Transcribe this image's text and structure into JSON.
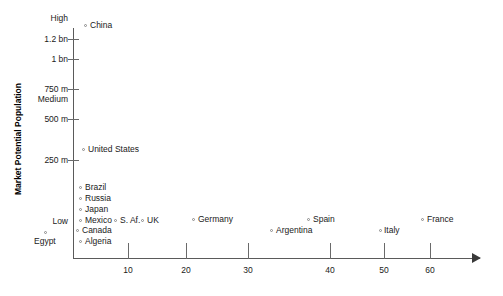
{
  "chart_data": {
    "type": "scatter",
    "title": "",
    "xlabel": "",
    "ylabel": "Market Potential Population",
    "xlim": [
      0,
      67
    ],
    "ylim": [
      0,
      1350
    ],
    "grid": false,
    "legend": null,
    "x_ticks": [
      {
        "label": "10",
        "value": 10,
        "px": 128
      },
      {
        "label": "20",
        "value": 20,
        "px": 186
      },
      {
        "label": "30",
        "value": 30,
        "px": 248
      },
      {
        "label": "40",
        "value": 40,
        "px": 330
      },
      {
        "label": "50",
        "value": 50,
        "px": 384
      },
      {
        "label": "60",
        "value": 60,
        "px": 430
      }
    ],
    "y_ticks": [
      {
        "label": "1.2 bn",
        "value": 1200,
        "px": 34,
        "tick": true
      },
      {
        "label": "1 bn",
        "value": 1000,
        "px": 54,
        "tick": true
      },
      {
        "label": "750 m",
        "value": 750,
        "px": 84,
        "tick": true
      },
      {
        "label": "500 m",
        "value": 500,
        "px": 114,
        "tick": true
      },
      {
        "label": "250 m",
        "value": 250,
        "px": 155,
        "tick": true
      }
    ],
    "y_band_labels": [
      {
        "label": "High",
        "px": 13
      },
      {
        "label": "Medium",
        "px": 94
      },
      {
        "label": "Low",
        "px": 216
      }
    ],
    "points": [
      {
        "name": "China",
        "x": 1.5,
        "y": 1300,
        "mx": 84,
        "my": 24,
        "lx": 90,
        "ly": 20
      },
      {
        "name": "United States",
        "x": 1.0,
        "y": 290,
        "mx": 82,
        "my": 148,
        "lx": 88,
        "ly": 144
      },
      {
        "name": "Brazil",
        "x": 0.5,
        "y": 175,
        "mx": 79,
        "my": 186,
        "lx": 85,
        "ly": 182
      },
      {
        "name": "Russia",
        "x": 0.5,
        "y": 145,
        "mx": 79,
        "my": 197,
        "lx": 85,
        "ly": 193
      },
      {
        "name": "Japan",
        "x": 0.5,
        "y": 125,
        "mx": 79,
        "my": 208,
        "lx": 85,
        "ly": 204
      },
      {
        "name": "Mexico",
        "x": 0.5,
        "y": 100,
        "mx": 79,
        "my": 219,
        "lx": 85,
        "ly": 215
      },
      {
        "name": "S. Af.",
        "x": 6.5,
        "y": 100,
        "mx": 114,
        "my": 219,
        "lx": 120,
        "ly": 215
      },
      {
        "name": "UK",
        "x": 11.0,
        "y": 100,
        "mx": 141,
        "my": 219,
        "lx": 147,
        "ly": 215
      },
      {
        "name": "Canada",
        "x": 0.2,
        "y": 75,
        "mx": 76,
        "my": 229,
        "lx": 82,
        "ly": 225
      },
      {
        "name": "Algeria",
        "x": 0.5,
        "y": 55,
        "mx": 79,
        "my": 240,
        "lx": 85,
        "ly": 236
      },
      {
        "name": "Egypt",
        "x": 0,
        "y": 70,
        "mx": 44,
        "my": 231,
        "lx": 34,
        "ly": 236
      },
      {
        "name": "Germany",
        "x": 20.5,
        "y": 105,
        "mx": 192,
        "my": 218,
        "lx": 198,
        "ly": 214
      },
      {
        "name": "Argentina",
        "x": 32.5,
        "y": 75,
        "mx": 270,
        "my": 229,
        "lx": 276,
        "ly": 225
      },
      {
        "name": "Spain",
        "x": 38.0,
        "y": 105,
        "mx": 307,
        "my": 218,
        "lx": 313,
        "ly": 214
      },
      {
        "name": "Italy",
        "x": 49.0,
        "y": 75,
        "mx": 379,
        "my": 229,
        "lx": 384,
        "ly": 225
      },
      {
        "name": "France",
        "x": 57.5,
        "y": 105,
        "mx": 421,
        "my": 218,
        "lx": 427,
        "ly": 214
      }
    ]
  }
}
